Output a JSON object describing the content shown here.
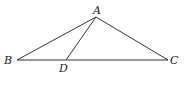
{
  "diagram": {
    "type": "triangle",
    "points": {
      "A": {
        "label": "A",
        "x": 96,
        "y": 17,
        "lx": 93,
        "ly": 14
      },
      "B": {
        "label": "B",
        "x": 17,
        "y": 60,
        "lx": 4,
        "ly": 64
      },
      "C": {
        "label": "C",
        "x": 168,
        "y": 60,
        "lx": 170,
        "ly": 64
      },
      "D": {
        "label": "D",
        "x": 66,
        "y": 60,
        "lx": 59,
        "ly": 72
      }
    },
    "segments": [
      [
        "A",
        "B"
      ],
      [
        "A",
        "C"
      ],
      [
        "B",
        "C"
      ],
      [
        "A",
        "D"
      ]
    ],
    "stroke_color": "#333333"
  }
}
